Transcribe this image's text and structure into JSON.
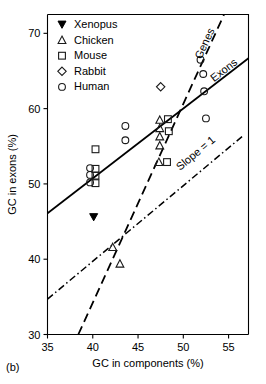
{
  "panel": {
    "label": "(b)"
  },
  "chart_data": {
    "type": "scatter",
    "title": "",
    "xlabel": "GC in components (%)",
    "ylabel": "GC in exons (%)",
    "xlim": [
      35,
      57.2
    ],
    "ylim": [
      30,
      72.5
    ],
    "xticks": [
      35,
      40,
      45,
      50,
      55
    ],
    "yticks": [
      30,
      40,
      50,
      60,
      70
    ],
    "xticklabels": [
      "35",
      "40",
      "45",
      "50",
      "55"
    ],
    "yticklabels": [
      "30",
      "40",
      "50",
      "60",
      "70"
    ],
    "grid": false,
    "legend_position": "top-left",
    "legend": [
      {
        "name": "Xenopus",
        "marker": "triangle-filled"
      },
      {
        "name": "Chicken",
        "marker": "triangle-open"
      },
      {
        "name": "Mouse",
        "marker": "square-open"
      },
      {
        "name": "Rabbit",
        "marker": "diamond-open"
      },
      {
        "name": "Human",
        "marker": "circle-open"
      }
    ],
    "series": [
      {
        "name": "Xenopus",
        "marker": "triangle-filled",
        "points": [
          {
            "x": 40.1,
            "y": 45.6
          }
        ]
      },
      {
        "name": "Chicken",
        "marker": "triangle-open",
        "points": [
          {
            "x": 42.2,
            "y": 41.6
          },
          {
            "x": 43.0,
            "y": 39.4
          },
          {
            "x": 47.4,
            "y": 58.5
          },
          {
            "x": 47.4,
            "y": 57.4
          },
          {
            "x": 47.4,
            "y": 56.3
          },
          {
            "x": 47.4,
            "y": 55.1
          },
          {
            "x": 47.3,
            "y": 52.9
          }
        ]
      },
      {
        "name": "Mouse",
        "marker": "square-open",
        "points": [
          {
            "x": 40.3,
            "y": 54.6
          },
          {
            "x": 40.3,
            "y": 52.0
          },
          {
            "x": 40.3,
            "y": 51.1
          },
          {
            "x": 40.3,
            "y": 50.1
          },
          {
            "x": 48.3,
            "y": 58.6
          },
          {
            "x": 48.4,
            "y": 57.0
          },
          {
            "x": 48.2,
            "y": 52.9
          }
        ]
      },
      {
        "name": "Rabbit",
        "marker": "diamond-open",
        "points": [
          {
            "x": 47.5,
            "y": 62.9
          }
        ]
      },
      {
        "name": "Human",
        "marker": "circle-open",
        "points": [
          {
            "x": 39.7,
            "y": 52.1
          },
          {
            "x": 39.7,
            "y": 51.2
          },
          {
            "x": 39.7,
            "y": 50.2
          },
          {
            "x": 43.6,
            "y": 57.7
          },
          {
            "x": 43.6,
            "y": 55.8
          },
          {
            "x": 51.9,
            "y": 66.5
          },
          {
            "x": 52.2,
            "y": 64.6
          },
          {
            "x": 52.3,
            "y": 62.3
          },
          {
            "x": 52.5,
            "y": 58.7
          }
        ]
      }
    ],
    "fit_lines": [
      {
        "name": "Exons",
        "style": "solid",
        "label": "Exons",
        "x0": 35.0,
        "y0": 46.1,
        "x1": 57.2,
        "y1": 66.7
      },
      {
        "name": "Genes",
        "style": "dashed",
        "label": "Genes",
        "x0": 38.4,
        "y0": 30.0,
        "x1": 54.5,
        "y1": 72.5
      },
      {
        "name": "Slope = 1",
        "style": "dash-dot",
        "label": "Slope = 1",
        "x0": 35.0,
        "y0": 34.7,
        "x1": 56.6,
        "y1": 56.4
      }
    ]
  }
}
